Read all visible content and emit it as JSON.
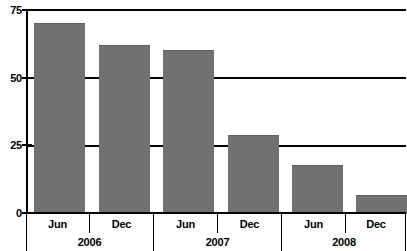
{
  "chart_data": {
    "type": "bar",
    "title": "",
    "subtitle": "",
    "xlabel": "",
    "ylabel": "",
    "ylim": [
      0,
      75
    ],
    "yticks": [
      0,
      25,
      50,
      75
    ],
    "ytick_labels": [
      "0",
      "25",
      "50",
      "75"
    ],
    "grid": true,
    "grid_axis": "y",
    "legend": false,
    "legend_position": "none",
    "categories": [
      "Jun",
      "Dec",
      "Jun",
      "Dec",
      "Jun",
      "Dec"
    ],
    "group_labels": [
      "2006",
      "2007",
      "2008"
    ],
    "group_spans": [
      2,
      2,
      2
    ],
    "values": [
      70,
      62,
      60,
      29,
      18,
      7
    ],
    "series": [
      {
        "name": "",
        "values": [
          70,
          62,
          60,
          29,
          18,
          7
        ]
      }
    ],
    "bar_color": "#717171",
    "axis_color": "#000000",
    "background_color": "#ffffff"
  },
  "axis": {
    "y_ticks": [
      {
        "label": "75",
        "value": 75
      },
      {
        "label": "50",
        "value": 50
      },
      {
        "label": "25",
        "value": 25
      },
      {
        "label": "0",
        "value": 0
      }
    ],
    "x_months": [
      {
        "label": "Jun"
      },
      {
        "label": "Dec"
      },
      {
        "label": "Jun"
      },
      {
        "label": "Dec"
      },
      {
        "label": "Jun"
      },
      {
        "label": "Dec"
      }
    ],
    "x_years": [
      {
        "label": "2006"
      },
      {
        "label": "2007"
      },
      {
        "label": "2008"
      }
    ]
  }
}
